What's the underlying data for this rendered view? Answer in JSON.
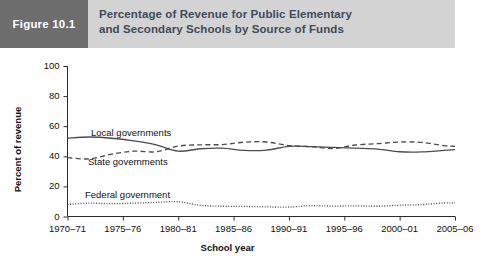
{
  "header": {
    "badge_label": "Figure 10.1",
    "title_line1": "Percentage of Revenue for Public Elementary",
    "title_line2": "and Secondary Schools by Source of Funds",
    "badge_bg": "#6d6d6d",
    "band_bg": "#d3d3d3",
    "title_color": "#3f4a5a"
  },
  "chart_data": {
    "type": "line",
    "title": "Percentage of Revenue for Public Elementary and Secondary Schools by Source of Funds",
    "xlabel": "School year",
    "ylabel": "Percent of revenue",
    "ylim": [
      0,
      100
    ],
    "yticks": [
      0,
      20,
      40,
      60,
      80,
      100
    ],
    "xlim": [
      1970,
      2005
    ],
    "xticks": [
      1970,
      1975,
      1980,
      1985,
      1990,
      1995,
      2000,
      2005
    ],
    "xtick_labels": [
      "1970–71",
      "1975–76",
      "1980–81",
      "1985–86",
      "1990–91",
      "1995–96",
      "2000–01",
      "2005–06"
    ],
    "grid": false,
    "legend_position": "inline-annotations",
    "x": [
      1970,
      1972,
      1974,
      1976,
      1978,
      1980,
      1982,
      1984,
      1986,
      1988,
      1990,
      1992,
      1994,
      1996,
      1998,
      2000,
      2002,
      2004,
      2005
    ],
    "series": [
      {
        "name": "Local governments",
        "style": "solid",
        "values": [
          52.1,
          52.8,
          52.0,
          50.2,
          47.6,
          43.4,
          45.0,
          45.4,
          43.9,
          44.1,
          46.6,
          46.4,
          45.9,
          45.4,
          44.8,
          43.0,
          42.9,
          43.9,
          44.4
        ]
      },
      {
        "name": "State governments",
        "style": "dashed",
        "values": [
          39.1,
          38.3,
          41.4,
          43.4,
          43.0,
          46.8,
          47.6,
          47.8,
          49.4,
          49.5,
          47.1,
          46.4,
          45.2,
          47.5,
          48.4,
          49.5,
          49.2,
          47.1,
          46.6
        ]
      },
      {
        "name": "Federal government",
        "style": "dotted",
        "values": [
          8.0,
          8.9,
          8.5,
          8.9,
          9.4,
          9.8,
          7.4,
          6.8,
          6.7,
          6.4,
          6.3,
          7.2,
          6.9,
          7.1,
          6.8,
          7.5,
          7.9,
          9.0,
          9.0
        ]
      }
    ],
    "annotations": [
      {
        "text": "Local governments",
        "series": "Local governments"
      },
      {
        "text": "State governments",
        "series": "State governments"
      },
      {
        "text": "Federal government",
        "series": "Federal government"
      }
    ]
  }
}
